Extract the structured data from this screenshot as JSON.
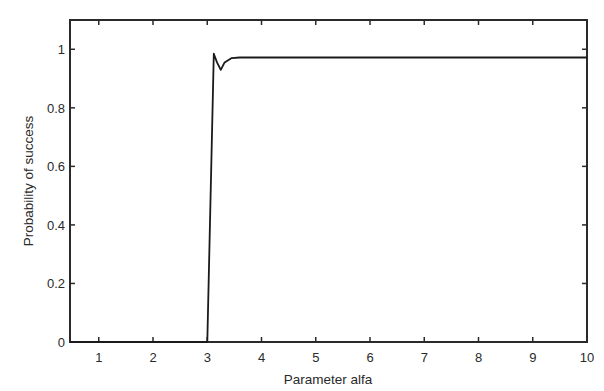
{
  "chart_data": {
    "type": "line",
    "title": "",
    "xlabel": "Parameter alfa",
    "ylabel": "Probability of success",
    "xlim": [
      0.47,
      10
    ],
    "ylim": [
      0,
      1.1
    ],
    "xticks": [
      1,
      2,
      3,
      4,
      5,
      6,
      7,
      8,
      9,
      10
    ],
    "xtick_labels": [
      "1",
      "2",
      "3",
      "4",
      "5",
      "6",
      "7",
      "8",
      "9",
      "10"
    ],
    "yticks": [
      0,
      0.2,
      0.4,
      0.6,
      0.8,
      1
    ],
    "ytick_labels": [
      "0",
      "0.2",
      "0.4",
      "0.6",
      "0.8",
      "1"
    ],
    "grid": false,
    "legend": null,
    "series": [
      {
        "name": "Probability of success",
        "color": "#1a1a1a",
        "x": [
          0.47,
          1,
          2,
          2.99,
          3.0,
          3.12,
          3.18,
          3.25,
          3.32,
          3.45,
          3.6,
          4,
          5,
          6,
          7,
          8,
          9,
          10
        ],
        "y": [
          0,
          0,
          0,
          0,
          0,
          0.985,
          0.955,
          0.93,
          0.955,
          0.97,
          0.972,
          0.972,
          0.972,
          0.972,
          0.972,
          0.972,
          0.972,
          0.972
        ]
      }
    ]
  },
  "colors": {
    "axis": "#2a2a2a",
    "line": "#1a1a1a",
    "background": "#ffffff"
  }
}
